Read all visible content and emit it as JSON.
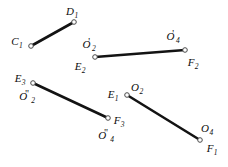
{
  "figure": {
    "name": "linkage-segment-diagram",
    "width": 228,
    "height": 167,
    "background_color": "#ffffff",
    "line_color": "#131313",
    "marker_fill_color": "#ffffff",
    "marker_stroke_color": "#4a4a4a"
  },
  "segments": [
    {
      "id": "segment-C1-D1",
      "x1": 31,
      "y1": 46,
      "x2": 74,
      "y2": 22
    },
    {
      "id": "segment-E2-F2",
      "x1": 95,
      "y1": 57,
      "x2": 185,
      "y2": 50
    },
    {
      "id": "segment-E3-F3",
      "x1": 33,
      "y1": 83,
      "x2": 108,
      "y2": 118
    },
    {
      "id": "segment-E1-F1",
      "x1": 127,
      "y1": 95,
      "x2": 200,
      "y2": 140
    }
  ],
  "points": [
    {
      "id": "point-D1",
      "x": 74,
      "y": 22
    },
    {
      "id": "point-C1",
      "x": 31,
      "y": 46
    },
    {
      "id": "point-E2",
      "x": 95,
      "y": 57
    },
    {
      "id": "point-F2",
      "x": 185,
      "y": 50
    },
    {
      "id": "point-E3",
      "x": 33,
      "y": 83
    },
    {
      "id": "point-F3",
      "x": 108,
      "y": 118
    },
    {
      "id": "point-E1",
      "x": 127,
      "y": 95
    },
    {
      "id": "point-F1",
      "x": 200,
      "y": 140
    }
  ],
  "labels": [
    {
      "id": "label-D1",
      "base": "D",
      "sub": "1",
      "prime": "",
      "x": 72,
      "y": 11
    },
    {
      "id": "label-C1",
      "base": "C",
      "sub": "1",
      "prime": "",
      "x": 17,
      "y": 41
    },
    {
      "id": "label-O2prime",
      "base": "O",
      "sub": "2",
      "prime": "'",
      "x": 89,
      "y": 44
    },
    {
      "id": "label-E2",
      "base": "E",
      "sub": "2",
      "prime": "",
      "x": 80,
      "y": 66
    },
    {
      "id": "label-O4prime",
      "base": "O",
      "sub": "4",
      "prime": "'",
      "x": 173,
      "y": 36
    },
    {
      "id": "label-F2",
      "base": "F",
      "sub": "2",
      "prime": "",
      "x": 193,
      "y": 62
    },
    {
      "id": "label-E3",
      "base": "E",
      "sub": "3",
      "prime": "",
      "x": 20,
      "y": 78
    },
    {
      "id": "label-O2dprime",
      "base": "O",
      "sub": "2",
      "prime": "\"",
      "x": 27,
      "y": 96
    },
    {
      "id": "label-E1",
      "base": "E",
      "sub": "1",
      "prime": "",
      "x": 113,
      "y": 94
    },
    {
      "id": "label-O2",
      "base": "O",
      "sub": "2",
      "prime": "",
      "x": 137,
      "y": 87
    },
    {
      "id": "label-F3",
      "base": "F",
      "sub": "3",
      "prime": "",
      "x": 119,
      "y": 120
    },
    {
      "id": "label-O4dprime",
      "base": "O",
      "sub": "4",
      "prime": "\"",
      "x": 106,
      "y": 135
    },
    {
      "id": "label-O4",
      "base": "O",
      "sub": "4",
      "prime": "",
      "x": 207,
      "y": 128
    },
    {
      "id": "label-F1",
      "base": "F",
      "sub": "1",
      "prime": "",
      "x": 212,
      "y": 148
    }
  ]
}
